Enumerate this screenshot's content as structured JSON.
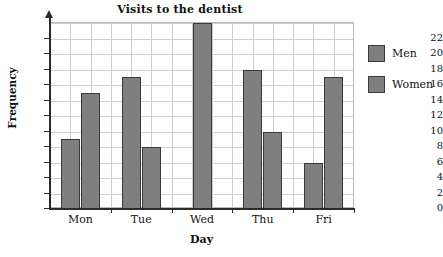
{
  "chart_data": {
    "type": "bar",
    "title": "Visits to the dentist",
    "xlabel": "Day",
    "ylabel": "Frequency",
    "categories": [
      "Mon",
      "Tue",
      "Wed",
      "Thu",
      "Fri"
    ],
    "series": [
      {
        "name": "Men",
        "values": [
          9,
          17,
          24,
          18,
          6
        ]
      },
      {
        "name": "Women",
        "values": [
          15,
          8,
          null,
          10,
          17
        ]
      }
    ],
    "ylim": [
      0,
      24
    ],
    "ytick_values": [
      0,
      2,
      4,
      6,
      8,
      10,
      12,
      14,
      16,
      18,
      20,
      22
    ],
    "ytick_labels": [
      "0",
      "2",
      "4",
      "6",
      "8",
      "10",
      "12",
      "14",
      "16",
      "18",
      "20",
      "22"
    ],
    "grid": true,
    "legend_position": "right",
    "legend": [
      "Men",
      "Women"
    ],
    "colors": {
      "bar_fill": "#7f7f7f",
      "bar_border": "#3a3a3a",
      "grid": "#cfcfcf",
      "axis": "#2b2b2b",
      "text": "#111111",
      "background": "#ffffff"
    }
  }
}
